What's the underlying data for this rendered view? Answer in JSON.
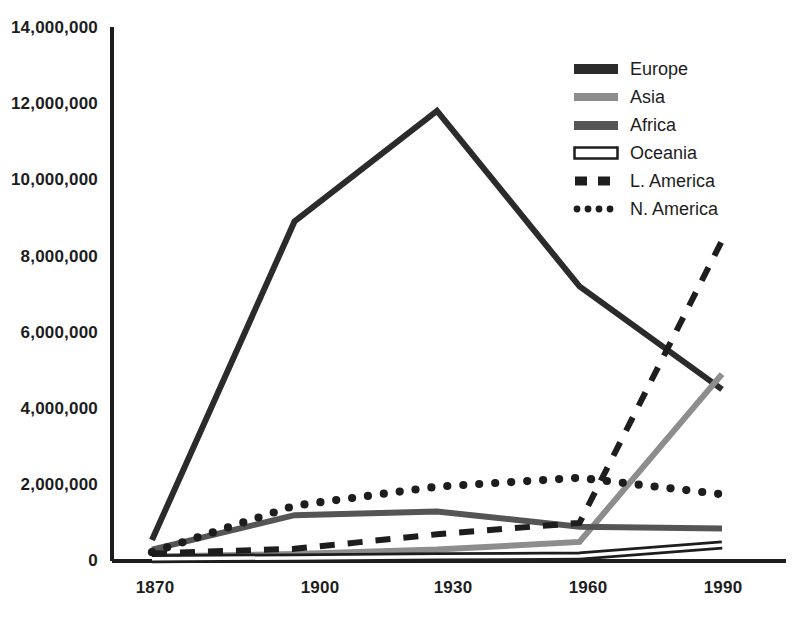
{
  "chart_data": {
    "type": "line",
    "title": "",
    "subtitle": "",
    "xlabel": "",
    "ylabel": "",
    "x": [
      1870,
      1900,
      1930,
      1960,
      1990
    ],
    "categories": [
      "1870",
      "1900",
      "1930",
      "1960",
      "1990"
    ],
    "xlim": [
      1870,
      1990
    ],
    "ylim": [
      0,
      14000000
    ],
    "grid": false,
    "legend_position": "top-right",
    "y_ticks": [
      0,
      2000000,
      4000000,
      6000000,
      8000000,
      10000000,
      12000000,
      14000000
    ],
    "y_tick_labels": [
      "0",
      "2,000,000",
      "4,000,000",
      "6,000,000",
      "8,000,000",
      "10,000,000",
      "12,000,000",
      "14,000,000"
    ],
    "x_tick_labels": [
      "1870",
      "1900",
      "1930",
      "1960",
      "1990"
    ],
    "series": [
      {
        "name": "Europe",
        "values": [
          550000,
          8900000,
          11800000,
          7200000,
          4500000
        ],
        "color": "#2b2b2b",
        "style": "solid",
        "width": 6
      },
      {
        "name": "Asia",
        "values": [
          120000,
          180000,
          300000,
          500000,
          4900000
        ],
        "color": "#8d8d8d",
        "style": "solid",
        "width": 6
      },
      {
        "name": "Africa",
        "values": [
          300000,
          1200000,
          1300000,
          900000,
          850000
        ],
        "color": "#555555",
        "style": "solid",
        "width": 6
      },
      {
        "name": "Oceania",
        "values": [
          60000,
          80000,
          110000,
          130000,
          420000
        ],
        "color": "#ffffff",
        "style": "solid-outline",
        "width": 6
      },
      {
        "name": "L. America",
        "values": [
          200000,
          320000,
          700000,
          1000000,
          8400000
        ],
        "color": "#1d1d1d",
        "style": "dashed",
        "width": 6
      },
      {
        "name": "N. America",
        "values": [
          230000,
          1450000,
          1950000,
          2180000,
          1750000
        ],
        "color": "#1d1d1d",
        "style": "dotted",
        "width": 7
      }
    ]
  },
  "axes": {
    "y_labels": [
      "14,000,000",
      "12,000,000",
      "10,000,000",
      "8,000,000",
      "6,000,000",
      "4,000,000",
      "2,000,000",
      "0"
    ],
    "x_labels": [
      "1870",
      "1900",
      "1930",
      "1960",
      "1990"
    ]
  },
  "legend": {
    "items": [
      {
        "label": "Europe",
        "swatch": "solid-dark"
      },
      {
        "label": "Asia",
        "swatch": "solid-light-gray"
      },
      {
        "label": "Africa",
        "swatch": "solid-mid-gray"
      },
      {
        "label": "Oceania",
        "swatch": "outline-white"
      },
      {
        "label": "L. America",
        "swatch": "dashed-dark"
      },
      {
        "label": "N. America",
        "swatch": "dotted-dark"
      }
    ]
  },
  "colors": {
    "europe": "#2b2b2b",
    "asia": "#8d8d8d",
    "africa": "#555555",
    "oceania": "#ffffff",
    "l_america": "#1d1d1d",
    "n_america": "#1d1d1d",
    "axis": "#1d1d1d",
    "background": "#ffffff"
  }
}
